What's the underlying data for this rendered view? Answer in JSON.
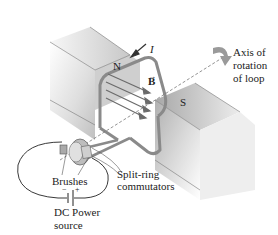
{
  "diagram": {
    "type": "dc-motor",
    "labels": {
      "north_pole": "N",
      "south_pole": "S",
      "current": "I",
      "magnetic_field": "B",
      "axis": [
        "Axis of",
        "rotation",
        "of loop"
      ],
      "brushes": "Brushes",
      "commutators": [
        "Split-ring",
        "commutators"
      ],
      "power_source": [
        "DC Power",
        "source"
      ],
      "minus": "−",
      "plus": "+"
    },
    "colors": {
      "magnet_light": "#f2f2f2",
      "magnet_dark": "#bdbdbd",
      "loop": "#8a8a8a",
      "arrow_dark": "#444444",
      "field_lines": "#6b6b6b",
      "wire": "#222222",
      "rotation_arrow": "#9a9a9a"
    }
  }
}
